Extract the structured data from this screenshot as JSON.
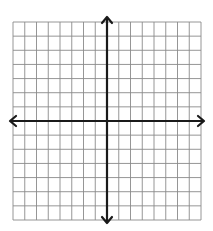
{
  "diagram": {
    "type": "coordinate-plane",
    "grid": {
      "columns": 16,
      "rows": 14,
      "left": 13,
      "right": 201,
      "top": 22,
      "bottom": 220,
      "line_color": "#8a8a8a",
      "line_width": 0.9
    },
    "axes": {
      "x_axis": {
        "y": 121,
        "x_start": 10,
        "x_end": 204,
        "arrows": [
          "left",
          "right"
        ]
      },
      "y_axis": {
        "x": 107,
        "y_start": 17,
        "y_end": 223,
        "arrows": [
          "up",
          "down"
        ]
      },
      "color": "#1a1a1a",
      "line_width": 2.2
    },
    "labels": [],
    "background": "#ffffff"
  }
}
